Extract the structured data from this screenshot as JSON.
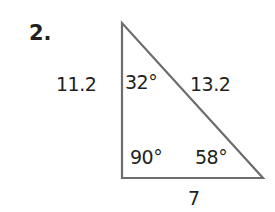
{
  "problem": {
    "number": "2."
  },
  "triangle": {
    "type": "right triangle",
    "sides": {
      "left": "11.2",
      "hypotenuse": "13.2",
      "bottom": "7"
    },
    "angles": {
      "top": "32°",
      "bottom_left": "90°",
      "bottom_right": "58°"
    },
    "stroke_color": "#6d6d6d"
  }
}
